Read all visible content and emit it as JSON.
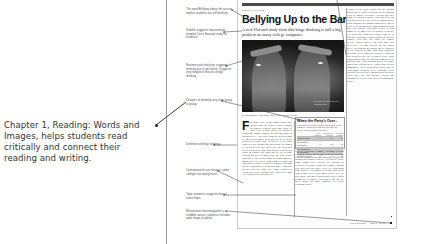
{
  "callout": {
    "text": "Chapter 1, Reading: Words and Images, helps students read critically and connect their reading and writing."
  },
  "annotations": [
    {
      "text": "The word Bellying above the picture implies students are still drinking.",
      "top": 8
    },
    {
      "text": "Subtitle suggests improvement needed. Uses Harvard study for evidence.",
      "top": 29
    },
    {
      "text": "Extreme and shocking; suggests drinking just to get drunk. Suggests very negative view of college drinking.",
      "top": 64
    },
    {
      "text": "Dangers of drinking vary from group to group.",
      "top": 99
    },
    {
      "text": "Definition of binge drinking.",
      "top": 143
    },
    {
      "text": "Consequences are serious; some colleges not doing much.",
      "top": 169
    },
    {
      "text": "Topic sentence suggests there's some hope.",
      "top": 193
    },
    {
      "text": "Mainstream newsmagazine a credible source; audience includes wide range of adults.",
      "top": 210
    }
  ],
  "article": {
    "kicker": "EDUCATION",
    "headline": "Bellying Up to the Bar",
    "dek": "A new Harvard study finds that binge drinking is still a big problem on many college campuses",
    "photo_caption": "Bottoms up: students at a campus party",
    "byline": "BY ELIZABETH MEHREN AND LAURA FITZPATRICK",
    "dropcap": "F",
    "col_a": "or many years, college administrators have worried about the culture of heavy drinking on campus. Students who binge drink are more likely to miss classes, fall behind in schoolwork, damage property, get hurt and engage in unplanned sex. A new study from the Harvard School of Public Health shows that nearly half of all college students still binge drink, defined as five or more drinks in a row for men and four or more for women at least once in the past two weeks. The researchers surveyed students at more than 100 four-year colleges across the country and found that the rate of binge drinking has barely budged since the study began. Bingeing is a pattern that shows up across campuses, though rates vary widely from school to school and from group to group. Students at schools with strong fraternity and sorority systems drink more. Among the colleges surveyed, some have made progress in cutting back heavy drinking, while others have done little to address the problem at all.",
    "col_b": "rates of occasional drinkers, often by tens of percentage points. Many colleges have tried to curb drinking through education campaigns, alcohol-free housing and tougher penalties, with mixed results. Some schools have focused on reducing the availability of cheap alcohol near campus, working with local bars and stores. There are encouraging signs, however. The number of students who abstain from alcohol entirely has grown steadily over the past decade, and more students now report living in alcohol-free residences. Researchers say that the social norms on many campuses are slowly beginning to shift.",
    "col_c": "Leaders of the study caution that the findings should not be read as a sign that college drinking is out of control everywhere. Colleges that have taken the problem seriously, enforcing rules and offering alternatives, have seen real improvements. Binge drinking rates among women have risen in recent years, narrowing the long-standing gap with men, and students who drink heavily in high school are far more likely to continue in college. The researchers found that students who live in fraternity and sorority houses remain the heaviest drinkers, with rates well above the campus average. Student athletes also drink more than their peers. Yet most students say they would prefer less drinking on campus and are bothered by the behavior of those who drink too much: interrupted sleep, unwanted advances, vandalism and having to care for a drunken friend. Some administrators argue that colleges cannot solve the problem alone, since drinking habits are shaped long before students arrive. Others point to local communities, where cheap drink specials and lax enforcement encourage heavy drinking. Public health officials say that a combination of strategies works best, and that colleges, parents and communities all have a role to play in changing the culture.",
    "sidebar": {
      "title": "When the Party's Over...",
      "intro": "Percentage of college students who drink, by the number of times they binged in the past two weeks, and the harms that result",
      "columns": [
        "",
        "Non-bingers",
        "Occasional bingers",
        "Frequent bingers"
      ],
      "rows": [
        {
          "label": "Missed a class",
          "values": [
            "8",
            "30",
            "63"
          ],
          "shaded": true
        },
        {
          "label": "Fell behind in schoolwork",
          "values": [
            "6",
            "21",
            "46"
          ],
          "shaded": false
        },
        {
          "label": "Had unplanned sexual activity",
          "values": [
            "8",
            "20",
            "42"
          ],
          "shaded": true
        },
        {
          "label": "Got hurt or injured",
          "values": [
            "2",
            "10",
            "27"
          ],
          "shaded": false
        }
      ]
    },
    "footer": "NEWSWEEK  ·  SEPT. 2002"
  }
}
